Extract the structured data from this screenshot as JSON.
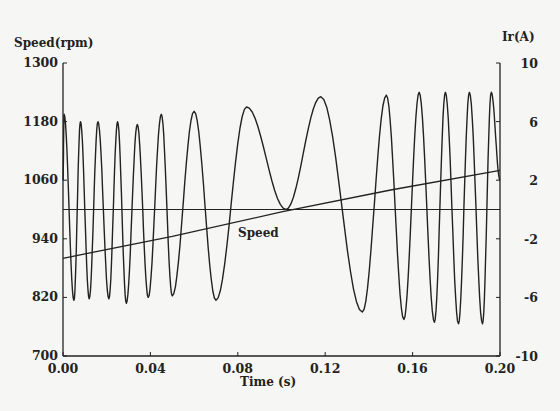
{
  "chart_data": {
    "type": "line",
    "title": "",
    "xlabel": "Time (s)",
    "ylabel": "Speed(rpm)",
    "y2label": "Ir(A)",
    "x_ticks": [
      "0.00",
      "0.04",
      "0.08",
      "0.12",
      "0.16",
      "0.20"
    ],
    "y_ticks": [
      "700",
      "820",
      "940",
      "1060",
      "1180",
      "1300"
    ],
    "y2_ticks": [
      "-10",
      "-6",
      "-2",
      "2",
      "6",
      "10"
    ],
    "xlim": [
      0.0,
      0.2
    ],
    "ylim": [
      700,
      1300
    ],
    "y2lim": [
      -10,
      10
    ],
    "grid": false,
    "annotations": [
      {
        "text": "Speed",
        "x": 0.083,
        "y": 950
      }
    ],
    "series": [
      {
        "name": "Speed",
        "axis": "left",
        "x": [
          0.0,
          0.05,
          0.1,
          0.15,
          0.2
        ],
        "values": [
          900,
          945,
          995,
          1040,
          1080
        ]
      },
      {
        "name": "Ir",
        "axis": "right",
        "description": "Rotor current, sinusoidal with frequency decreasing to near zero at ~0.102 s then increasing again (slip frequency crossing zero); amplitude about 6-8 A",
        "x_peaks": [
          0.0005,
          0.008,
          0.016,
          0.025,
          0.034,
          0.045,
          0.06,
          0.084,
          0.118,
          0.148,
          0.163,
          0.175,
          0.186,
          0.196
        ],
        "peak_values": [
          6.5,
          6,
          6,
          6,
          5.8,
          6.5,
          6.7,
          7,
          7.7,
          7.8,
          8,
          8,
          8,
          8
        ],
        "x_valleys": [
          0.005,
          0.012,
          0.021,
          0.029,
          0.039,
          0.05,
          0.07,
          0.102,
          0.137,
          0.156,
          0.17,
          0.181,
          0.192
        ],
        "valley_values": [
          -6.2,
          -6.1,
          -6.1,
          -6.4,
          -6,
          -5.9,
          -6.2,
          0,
          -7,
          -7.5,
          -7.7,
          -7.8,
          -7.8
        ]
      }
    ],
    "reference_line": {
      "axis": "right",
      "value": 0
    }
  }
}
